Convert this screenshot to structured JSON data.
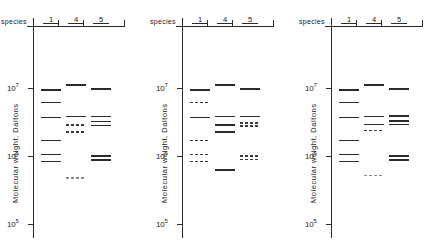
{
  "figure": {
    "panel_count": 3,
    "axis": {
      "title": "Molecular weight, Daltons",
      "scale": "log10",
      "ticks": [
        {
          "label": "10",
          "exponent": "7",
          "value": 10000000
        },
        {
          "label": "10",
          "exponent": "6",
          "value": 1000000
        },
        {
          "label": "10",
          "exponent": "5",
          "value": 100000
        }
      ]
    },
    "header": {
      "species_label": "species",
      "lanes": [
        "1",
        "4",
        "5"
      ]
    },
    "colors": {
      "ink": "#2a2a2a",
      "band_solid": "#2b2b2b",
      "band_faint": "#6e6e6e",
      "background": "#ffffff"
    }
  },
  "chart_data": {
    "type": "table",
    "title": "",
    "xlabel": "species",
    "ylabel": "Molecular weight, Daltons",
    "ylim": [
      100000,
      20000000
    ],
    "yscale": "log",
    "ytick_values": [
      10000000,
      1000000,
      100000
    ],
    "ytick_labels": [
      "10^7",
      "10^6",
      "10^5"
    ],
    "grid": false,
    "legend": "none",
    "categories": [
      "1",
      "4",
      "5"
    ],
    "panels": [
      {
        "name": "panel-1",
        "lanes": [
          {
            "species": "1",
            "bands": [
              {
                "mw": 9400000,
                "style": "solid"
              },
              {
                "mw": 6100000,
                "style": "solid"
              },
              {
                "mw": 3700000,
                "style": "solid"
              },
              {
                "mw": 1700000,
                "style": "solid"
              },
              {
                "mw": 1050000,
                "style": "solid"
              },
              {
                "mw": 830000,
                "style": "solid"
              }
            ]
          },
          {
            "species": "4",
            "bands": [
              {
                "mw": 11000000,
                "style": "solid"
              },
              {
                "mw": 3800000,
                "style": "solid"
              },
              {
                "mw": 2850000,
                "style": "dashed"
              },
              {
                "mw": 2250000,
                "style": "dashed"
              },
              {
                "mw": 470000,
                "style": "dashed-faint"
              }
            ]
          },
          {
            "species": "5",
            "bands": [
              {
                "mw": 9600000,
                "style": "solid"
              },
              {
                "mw": 3800000,
                "style": "solid"
              },
              {
                "mw": 3200000,
                "style": "solid"
              },
              {
                "mw": 2800000,
                "style": "solid"
              },
              {
                "mw": 1000000,
                "style": "solid"
              },
              {
                "mw": 880000,
                "style": "solid"
              }
            ]
          }
        ]
      },
      {
        "name": "panel-2",
        "lanes": [
          {
            "species": "1",
            "bands": [
              {
                "mw": 9400000,
                "style": "solid"
              },
              {
                "mw": 6100000,
                "style": "dashed"
              },
              {
                "mw": 3700000,
                "style": "solid"
              },
              {
                "mw": 1700000,
                "style": "dashed"
              },
              {
                "mw": 1050000,
                "style": "dashed"
              },
              {
                "mw": 830000,
                "style": "dashed"
              }
            ]
          },
          {
            "species": "4",
            "bands": [
              {
                "mw": 11000000,
                "style": "solid"
              },
              {
                "mw": 3800000,
                "style": "solid"
              },
              {
                "mw": 2850000,
                "style": "solid"
              },
              {
                "mw": 2250000,
                "style": "solid"
              },
              {
                "mw": 620000,
                "style": "solid"
              }
            ]
          },
          {
            "species": "5",
            "bands": [
              {
                "mw": 9600000,
                "style": "solid"
              },
              {
                "mw": 3800000,
                "style": "solid"
              },
              {
                "mw": 3050000,
                "style": "dashed"
              },
              {
                "mw": 2750000,
                "style": "dashed"
              },
              {
                "mw": 1000000,
                "style": "dashed"
              },
              {
                "mw": 880000,
                "style": "dashed"
              }
            ]
          }
        ]
      },
      {
        "name": "panel-3",
        "lanes": [
          {
            "species": "1",
            "bands": [
              {
                "mw": 9400000,
                "style": "solid"
              },
              {
                "mw": 6100000,
                "style": "solid"
              },
              {
                "mw": 3700000,
                "style": "solid"
              },
              {
                "mw": 1700000,
                "style": "solid"
              },
              {
                "mw": 1050000,
                "style": "solid"
              },
              {
                "mw": 830000,
                "style": "solid"
              }
            ]
          },
          {
            "species": "4",
            "bands": [
              {
                "mw": 11000000,
                "style": "solid"
              },
              {
                "mw": 3800000,
                "style": "solid"
              },
              {
                "mw": 2900000,
                "style": "solid"
              },
              {
                "mw": 2350000,
                "style": "dashed"
              },
              {
                "mw": 520000,
                "style": "dashed-faint"
              }
            ]
          },
          {
            "species": "5",
            "bands": [
              {
                "mw": 9600000,
                "style": "solid"
              },
              {
                "mw": 3900000,
                "style": "solid"
              },
              {
                "mw": 3300000,
                "style": "solid"
              },
              {
                "mw": 2900000,
                "style": "solid"
              },
              {
                "mw": 1000000,
                "style": "solid"
              },
              {
                "mw": 880000,
                "style": "solid"
              }
            ]
          }
        ]
      }
    ]
  }
}
